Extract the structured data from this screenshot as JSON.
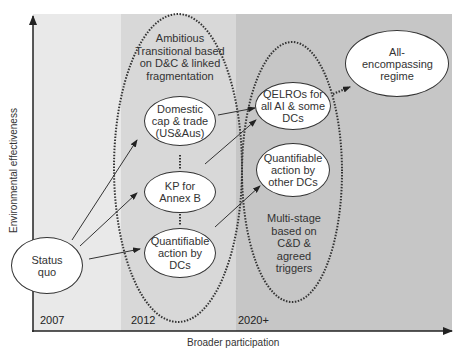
{
  "axes": {
    "x_label": "Broader participation",
    "y_label": "Environmental effectiveness"
  },
  "bands": [
    {
      "year": "2007",
      "color": "#e9e9e9"
    },
    {
      "year": "2012",
      "color": "#d8d8d8"
    },
    {
      "year": "2020+",
      "color": "#c6c6c6"
    }
  ],
  "groups": {
    "transitional": "Ambitious Transitional based on D&C & linked fragmentation",
    "multistage": "Multi-stage based on C&D & agreed triggers"
  },
  "nodes": {
    "status_quo": "Status quo",
    "domestic_cap": "Domestic cap & trade (US&Aus)",
    "kp_annex_b": "KP for Annex B",
    "quant_dcs": "Quantifiable action by DCs",
    "qelros": "QELROs for all AI & some DCs",
    "quant_other_dcs": "Quantifiable action by other DCs",
    "all_encompassing": "All-encompassing regime"
  }
}
